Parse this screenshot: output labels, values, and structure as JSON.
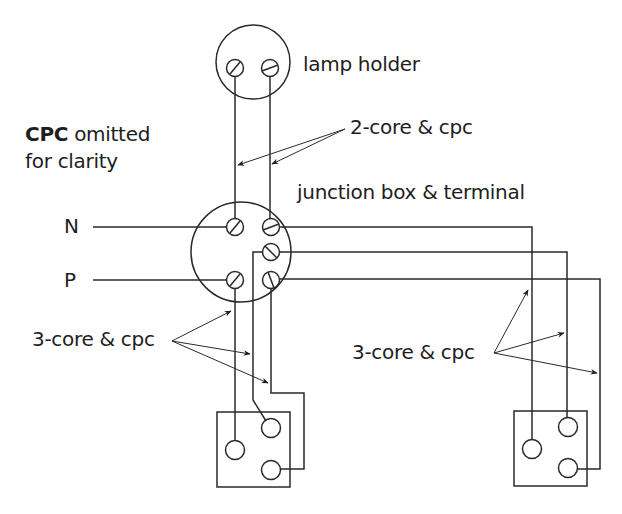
{
  "diagram": {
    "stroke_color": "#2a2a2a",
    "background": "#ffffff",
    "labels": {
      "lamp_holder": "lamp holder",
      "cpc_bold": "CPC",
      "cpc_rest": " omitted",
      "cpc_line2": "for clarity",
      "two_core": "2-core & cpc",
      "junction_box": "junction box & terminal",
      "neutral": "N",
      "phase": "P",
      "three_core_left": "3-core & cpc",
      "three_core_right": "3-core & cpc"
    },
    "components": [
      {
        "name": "lamp holder",
        "terminals": 2
      },
      {
        "name": "junction box",
        "terminals": 5
      },
      {
        "name": "two-way switch left",
        "terminals": 3
      },
      {
        "name": "two-way switch right",
        "terminals": 3
      }
    ],
    "supply": [
      "N",
      "P"
    ]
  }
}
